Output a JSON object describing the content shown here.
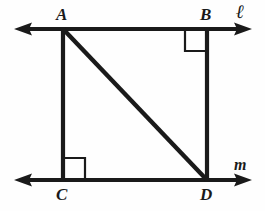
{
  "figure": {
    "type": "geometry-diagram",
    "background_color": "#fefefe",
    "stroke_color": "#1a1a1a",
    "points": [
      {
        "id": "A",
        "label": "A",
        "x": 63,
        "y": 29,
        "label_x": 56,
        "label_y": 6,
        "right_angle": false
      },
      {
        "id": "B",
        "label": "B",
        "x": 207,
        "y": 29,
        "label_x": 200,
        "label_y": 6,
        "right_angle": true
      },
      {
        "id": "C",
        "label": "C",
        "x": 63,
        "y": 180,
        "label_x": 56,
        "label_y": 186,
        "right_angle": true
      },
      {
        "id": "D",
        "label": "D",
        "x": 207,
        "y": 180,
        "label_x": 200,
        "label_y": 186,
        "right_angle": false
      }
    ],
    "lines": [
      {
        "id": "l",
        "label": "ℓ",
        "kind": "double-arrow-horizontal",
        "y": 29,
        "x_start": 16,
        "x_end": 250,
        "label_x": 236,
        "label_y": 2
      },
      {
        "id": "m",
        "label": "m",
        "kind": "double-arrow-horizontal",
        "y": 180,
        "x_start": 16,
        "x_end": 250,
        "label_x": 234,
        "label_y": 157
      }
    ],
    "segments": [
      {
        "id": "AC",
        "from": "A",
        "to": "C",
        "kind": "vertical"
      },
      {
        "id": "BD",
        "from": "B",
        "to": "D",
        "kind": "vertical"
      },
      {
        "id": "AD",
        "from": "A",
        "to": "D",
        "kind": "diagonal"
      }
    ],
    "right_angle_marks": [
      {
        "id": "angle-B",
        "at": "B",
        "size": 22,
        "orientation": "down-left"
      },
      {
        "id": "angle-C",
        "at": "C",
        "size": 22,
        "orientation": "up-right"
      }
    ]
  }
}
